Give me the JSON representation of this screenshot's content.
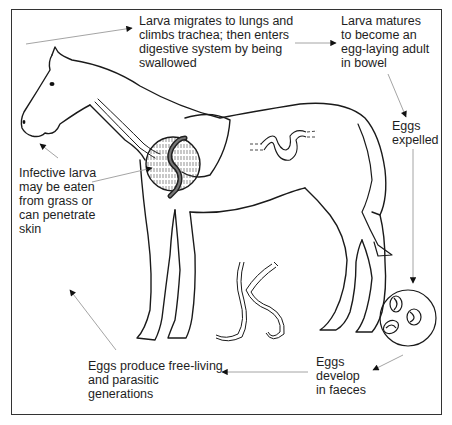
{
  "diagram": {
    "colors": {
      "line": "#1a1a1a",
      "arrow": "#999999",
      "frame": "#333333",
      "background": "#ffffff"
    },
    "labels": {
      "larva_migrates": "Larva migrates to lungs and\nclimbs trachea; then enters\ndigestive system by being\nswallowed",
      "larva_matures": "Larva matures\nto become an\negg-laying adult\nin bowel",
      "eggs_expelled": "Eggs\nexpelled",
      "infective_larva": "Infective larva\nmay be eaten\nfrom grass or\ncan penetrate\nskin",
      "eggs_produce": "Eggs produce free-living\nand parasitic\ngenerations",
      "eggs_develop": "Eggs\ndevelop\nin faeces"
    },
    "illustrations": [
      "horse-outline",
      "lung-inset-with-larva",
      "adult-worm-in-bowel",
      "free-living-worms",
      "eggs-in-faeces-circle"
    ],
    "cycle_steps": [
      "Infective larva may be eaten from grass or can penetrate skin",
      "Larva migrates to lungs and climbs trachea; then enters digestive system by being swallowed",
      "Larva matures to become an egg-laying adult in bowel",
      "Eggs expelled",
      "Eggs develop in faeces",
      "Eggs produce free-living and parasitic generations"
    ]
  }
}
